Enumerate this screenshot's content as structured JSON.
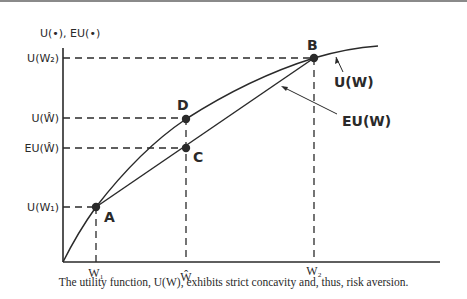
{
  "figure": {
    "y_axis_label": "U(•), EU(•)",
    "y_ticks": [
      "U(W₂)",
      "U(Ŵ)",
      "EU(Ŵ)",
      "U(W₁)"
    ],
    "x_ticks": [
      "W₁",
      "Ŵ",
      "W₂"
    ],
    "points": [
      "A",
      "B",
      "C",
      "D"
    ],
    "curve_labels": {
      "utility": "U(W)",
      "expected_utility": "EU(W)"
    },
    "caption": "The utility function, U(W), exhibits strict concavity and, thus, risk aversion."
  },
  "colors": {
    "ink": "#2a2a2a",
    "border": "#8a8a8a"
  }
}
